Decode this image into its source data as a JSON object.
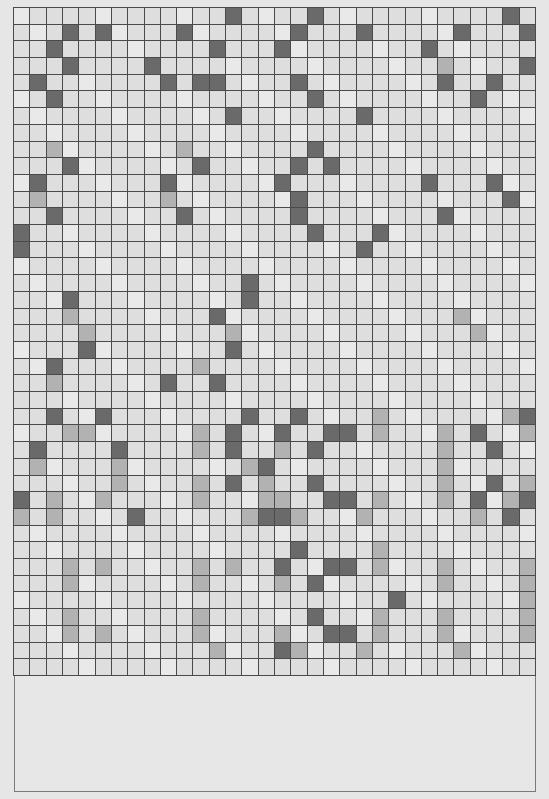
{
  "board": {
    "columns": 32,
    "rows": 40,
    "legend": {
      ".": "light",
      "M": "medium",
      "D": "dark"
    },
    "colors": {
      "light": "#dedede",
      "light_alt": "#e9e9e9",
      "medium": "#b2b2b2",
      "dark": "#6a6a6a",
      "grid_line": "#4a4a4a",
      "background": "#e6e6e6"
    },
    "cells": [
      ".............D....D...........D.",
      "...D.D....D......D...D.....D...D",
      "..D.........D...D........D......",
      "...D....D.................M....D",
      ".D.......D.DD....D........D..D..",
      "..D...............D.........D...",
      ".............D.......D..........",
      "................................",
      "..M.......M.......D.............",
      "...D.......D.....D.D............",
      ".D.......D......D........D...D..",
      ".M.......M.......D............D.",
      "..D.......D......D........D.....",
      "D.................D...D.........",
      "D....................D..........",
      "................................",
      "..............D.................",
      "...D..........D.................",
      "...M........D..............M....",
      "....M........M..............M...",
      "....D........D..................",
      "..D........M....................",
      "..M......D..D...................",
      "................................",
      "..D..D........D..D....M.......MD",
      "...MM......M.D..D..DD.M...M.D..M",
      ".D....D....M.D..M.D.......M..D..",
      ".M....M.......MD..........M.....",
      "......M....M.D.M..D.......M..D.M",
      "D.M..M.....M...MM..DD.M...M.D.MD",
      "M.M....D......MDDM...M......M.D.",
      "................................",
      ".................D....M.........",
      "...M.M.....M.M..D..DD.M...M....M",
      "...M.......M....M.D.......M....M",
      ".......................D.......M",
      "...M.......M......D...M...M....M",
      "...M.M.....M....M..DD.M...M....M",
      "............M...DM...M.....M....",
      "................................"
    ]
  },
  "info_panel": {
    "text": ""
  }
}
